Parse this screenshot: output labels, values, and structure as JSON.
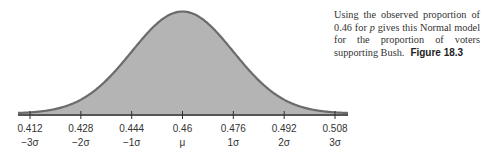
{
  "chart_data": {
    "type": "area",
    "title": "Normal model for the proportion of voters supporting Bush",
    "distribution": "normal",
    "mean": 0.46,
    "sd": 0.016,
    "xlabel": "",
    "ylabel": "",
    "x_ticks": [
      0.412,
      0.428,
      0.444,
      0.46,
      0.476,
      0.492,
      0.508
    ],
    "x_tick_labels": [
      "0.412",
      "0.428",
      "0.444",
      "0.46",
      "0.476",
      "0.492",
      "0.508"
    ],
    "sigma_labels": [
      "−3σ",
      "−2σ",
      "−1σ",
      "μ",
      "1σ",
      "2σ",
      "3σ"
    ],
    "xlim": [
      0.404,
      0.516
    ],
    "grid": false,
    "legend": "none",
    "colors": {
      "fill": "#b4b4b4",
      "curve": "#6b6b6b",
      "axis": "#555555"
    }
  },
  "caption": {
    "text_before_p": "Using the observed proportion of 0.46 for ",
    "p_symbol": "p",
    "text_after_p": " gives this Normal model for the proportion of voters supporting Bush.",
    "figure_label": "Figure 18.3"
  }
}
